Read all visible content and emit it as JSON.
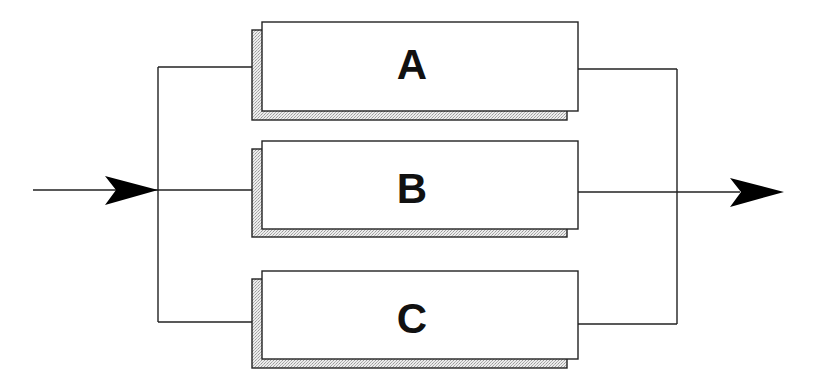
{
  "diagram": {
    "type": "parallel-redundancy-block-diagram",
    "colors": {
      "line": "#222222",
      "background": "#ffffff",
      "shadow": "#d8d8d8",
      "arrow": "#000000"
    },
    "blocks": [
      {
        "label": "A"
      },
      {
        "label": "B"
      },
      {
        "label": "C"
      }
    ],
    "input_arrow": {
      "direction": "right"
    },
    "output_arrow": {
      "direction": "right"
    }
  }
}
